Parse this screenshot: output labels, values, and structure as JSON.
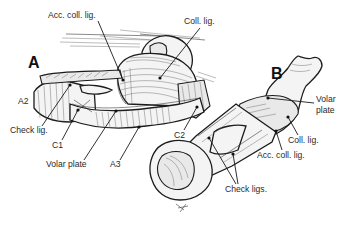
{
  "figure": {
    "panels": [
      {
        "id": "A",
        "label": "A",
        "annotations": [
          {
            "key": "acc_coll_lig",
            "text": "Acc. coll. lig."
          },
          {
            "key": "coll_lig",
            "text": "Coll. lig."
          },
          {
            "key": "a2",
            "text": "A2"
          },
          {
            "key": "check_lig",
            "text": "Check lig."
          },
          {
            "key": "c1",
            "text": "C1"
          },
          {
            "key": "volar_plate",
            "text": "Volar plate"
          },
          {
            "key": "a3",
            "text": "A3"
          },
          {
            "key": "c2",
            "text": "C2"
          }
        ]
      },
      {
        "id": "B",
        "label": "B",
        "annotations": [
          {
            "key": "volar_plate_line1",
            "text": "Volar"
          },
          {
            "key": "volar_plate_line2",
            "text": "plate"
          },
          {
            "key": "coll_lig",
            "text": "Coll. lig."
          },
          {
            "key": "acc_coll_lig",
            "text": "Acc. coll. lig."
          },
          {
            "key": "check_ligs",
            "text": "Check ligs."
          }
        ]
      }
    ],
    "colors": {
      "background": "#ffffff",
      "ink": "#1a1a1a",
      "label_text": "#2a2a2a"
    }
  }
}
